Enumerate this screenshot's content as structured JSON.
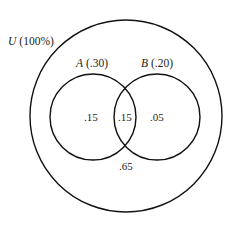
{
  "diagram": {
    "type": "venn",
    "universe": {
      "letter": "U",
      "value": "(100%)"
    },
    "sets": [
      {
        "letter": "A",
        "value": "(.30)"
      },
      {
        "letter": "B",
        "value": "(.20)"
      }
    ],
    "regions": {
      "a_only": ".15",
      "a_and_b": ".15",
      "b_only": ".05",
      "neither": ".65"
    },
    "colors": {
      "stroke": "#111111",
      "background": "#ffffff",
      "text": "#222222"
    }
  }
}
